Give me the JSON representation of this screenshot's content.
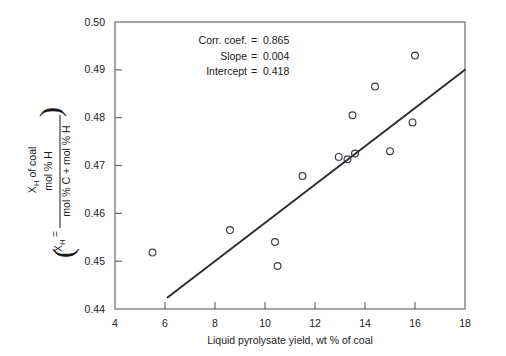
{
  "chart_data": {
    "type": "scatter",
    "title": "",
    "xlabel": "Liquid pyrolysate yield, wt % of coal",
    "ylabel_line1": "X",
    "ylabel_line1_sub": "H",
    "ylabel_line1_rest": " of coal",
    "ylabel_numerator": "mol % H",
    "ylabel_denominator": "mol % C + mol % H",
    "ylabel_prefix": "X",
    "ylabel_prefix_sub": "H",
    "ylabel_equals": "=",
    "xlim": [
      4,
      18
    ],
    "ylim": [
      0.44,
      0.5
    ],
    "xticks": [
      4,
      6,
      8,
      10,
      12,
      14,
      16,
      18
    ],
    "xticklabels": [
      "4",
      "6",
      "8",
      "10",
      "12",
      "14",
      "16",
      "18"
    ],
    "yticks": [
      0.44,
      0.45,
      0.46,
      0.47,
      0.48,
      0.49,
      0.5
    ],
    "yticklabels": [
      "0.44",
      "0.45",
      "0.46",
      "0.47",
      "0.48",
      "0.49",
      "0.50"
    ],
    "grid": false,
    "legend": null,
    "marker": "open-circle",
    "marker_color": "#3a3a4a",
    "line_color": "#2b2b33",
    "points": [
      {
        "x": 5.5,
        "y": 0.4518
      },
      {
        "x": 8.6,
        "y": 0.4565
      },
      {
        "x": 10.4,
        "y": 0.454
      },
      {
        "x": 10.5,
        "y": 0.449
      },
      {
        "x": 11.5,
        "y": 0.4678
      },
      {
        "x": 12.95,
        "y": 0.4718
      },
      {
        "x": 13.3,
        "y": 0.4713
      },
      {
        "x": 13.6,
        "y": 0.4725
      },
      {
        "x": 13.5,
        "y": 0.4805
      },
      {
        "x": 14.4,
        "y": 0.4865
      },
      {
        "x": 15.0,
        "y": 0.473
      },
      {
        "x": 15.9,
        "y": 0.479
      },
      {
        "x": 16.0,
        "y": 0.493
      }
    ],
    "fit_line": {
      "slope": 0.004,
      "intercept": 0.418,
      "x_start": 6.1,
      "x_end": 18.0,
      "y_start": 0.4424,
      "y_end": 0.49
    },
    "annotations": [
      {
        "label": "Corr. coef.",
        "equals": "=",
        "value": "0.865"
      },
      {
        "label": "Slope",
        "equals": "=",
        "value": "0.004"
      },
      {
        "label": "Intercept",
        "equals": "=",
        "value": "0.418"
      }
    ]
  }
}
